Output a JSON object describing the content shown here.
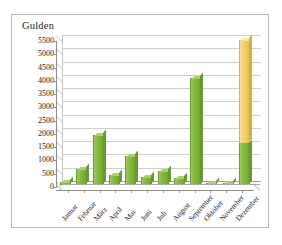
{
  "chart_data": {
    "type": "bar",
    "title": "",
    "ylabel": "Gulden",
    "xlabel": "",
    "categories": [
      "Januar",
      "Februar",
      "März",
      "April",
      "Mai",
      "Juni",
      "Juli",
      "August",
      "September",
      "Oktober",
      "November",
      "Dezember"
    ],
    "yticks": [
      0,
      500,
      1000,
      1500,
      2000,
      2500,
      3000,
      3500,
      4000,
      4500,
      5000,
      5500
    ],
    "ytick_labels": [
      "0",
      "500",
      "1000",
      "1500",
      "2000",
      "2500",
      "3000",
      "3500",
      "4000",
      "4500",
      "5000",
      "5500"
    ],
    "ylim": [
      0,
      5500
    ],
    "grid": true,
    "legend": "none",
    "stacked": true,
    "three_d": true,
    "series": [
      {
        "name": "green",
        "color": "#86b93c",
        "values": [
          100,
          620,
          1880,
          380,
          1080,
          300,
          540,
          250,
          4050,
          80,
          60,
          1600
        ]
      },
      {
        "name": "yellow",
        "color": "#efc95f",
        "values": [
          0,
          0,
          0,
          0,
          0,
          0,
          0,
          0,
          0,
          0,
          0,
          3850
        ]
      }
    ],
    "totals": [
      100,
      620,
      1880,
      380,
      1080,
      300,
      540,
      250,
      4050,
      80,
      60,
      5450
    ],
    "colors": {
      "green": "#86b93c",
      "yellow": "#efc95f",
      "grid": "#cfcfcf",
      "axis": "#8f8f8f",
      "frame": "#b9b9b9",
      "text": "#1a1a1a",
      "background": "#ffffff"
    }
  }
}
